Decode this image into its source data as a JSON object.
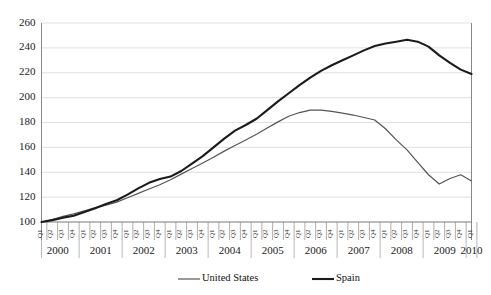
{
  "chart_data": {
    "type": "line",
    "title": "",
    "xlabel": "",
    "ylabel": "",
    "ylim": [
      100,
      260
    ],
    "y_ticks": [
      100,
      120,
      140,
      160,
      180,
      200,
      220,
      240,
      260
    ],
    "grid": true,
    "legend_position": "bottom",
    "x_quarter_labels": [
      "Q1",
      "Q2",
      "Q3",
      "Q4"
    ],
    "years": [
      "2000",
      "2001",
      "2002",
      "2003",
      "2004",
      "2005",
      "2006",
      "2007",
      "2008",
      "2009",
      "2010"
    ],
    "x": [
      "2000 Q1",
      "2000 Q2",
      "2000 Q3",
      "2000 Q4",
      "2001 Q1",
      "2001 Q2",
      "2001 Q3",
      "2001 Q4",
      "2002 Q1",
      "2002 Q2",
      "2002 Q3",
      "2002 Q4",
      "2003 Q1",
      "2003 Q2",
      "2003 Q3",
      "2003 Q4",
      "2004 Q1",
      "2004 Q2",
      "2004 Q3",
      "2004 Q4",
      "2005 Q1",
      "2005 Q2",
      "2005 Q3",
      "2005 Q4",
      "2006 Q1",
      "2006 Q2",
      "2006 Q3",
      "2006 Q4",
      "2007 Q1",
      "2007 Q2",
      "2007 Q3",
      "2007 Q4",
      "2008 Q1",
      "2008 Q2",
      "2008 Q3",
      "2008 Q4",
      "2009 Q1",
      "2009 Q2",
      "2009 Q3",
      "2009 Q4",
      "2010 Q1"
    ],
    "series": [
      {
        "name": "United States",
        "color": "#555555",
        "width": 1.2,
        "values": [
          100.0,
          102.0,
          104.5,
          106.5,
          109.0,
          111.5,
          113.5,
          116.0,
          119.5,
          123.0,
          126.5,
          130.0,
          134.0,
          138.5,
          143.0,
          147.5,
          152.0,
          157.0,
          161.5,
          166.0,
          170.5,
          175.5,
          180.5,
          185.0,
          188.0,
          190.0,
          190.0,
          189.0,
          187.5,
          186.0,
          184.0,
          182.0,
          175.0,
          166.0,
          158.0,
          148.0,
          138.0,
          130.5,
          135.0,
          138.0,
          133.0
        ]
      },
      {
        "name": "Spain",
        "color": "#1b1b1b",
        "width": 2.1,
        "values": [
          100.0,
          101.5,
          103.5,
          105.0,
          108.0,
          111.0,
          114.5,
          117.5,
          122.0,
          127.0,
          131.5,
          134.5,
          136.5,
          141.0,
          147.0,
          153.0,
          160.0,
          167.0,
          173.5,
          178.0,
          183.0,
          190.0,
          197.0,
          203.5,
          210.0,
          216.0,
          221.5,
          226.0,
          230.0,
          234.0,
          238.0,
          241.5,
          243.5,
          245.0,
          246.5,
          245.0,
          241.0,
          234.0,
          228.0,
          222.5,
          219.0
        ]
      }
    ]
  },
  "legend": {
    "items": [
      {
        "label": "United States"
      },
      {
        "label": "Spain"
      }
    ]
  }
}
